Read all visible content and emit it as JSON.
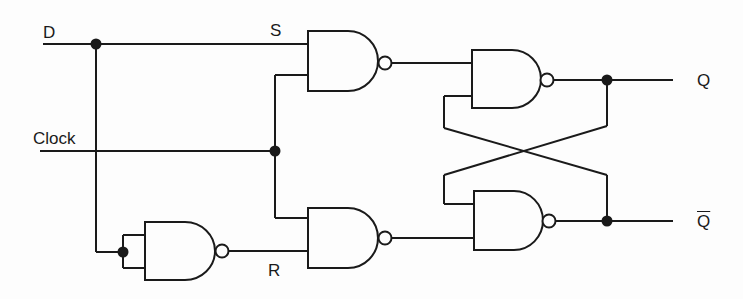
{
  "diagram": {
    "labels": {
      "d_input": "D",
      "clock_input": "Clock",
      "s_signal": "S",
      "r_signal": "R",
      "q_output": "Q",
      "q_bar_output": "Q"
    },
    "components": [
      {
        "id": "inverter-nand",
        "type": "NAND",
        "role": "inverter",
        "inputs_tied": true
      },
      {
        "id": "s-nand",
        "type": "NAND",
        "inputs": [
          "D",
          "Clock"
        ],
        "output": "S"
      },
      {
        "id": "r-nand",
        "type": "NAND",
        "inputs": [
          "Clock",
          "NOT D"
        ],
        "output": "R"
      },
      {
        "id": "latch-top-nand",
        "type": "NAND",
        "inputs": [
          "S",
          "Q-bar"
        ],
        "output": "Q"
      },
      {
        "id": "latch-bottom-nand",
        "type": "NAND",
        "inputs": [
          "Q",
          "R"
        ],
        "output": "Q-bar"
      }
    ],
    "colors": {
      "line": "#1a1a1a",
      "background": "#fdfdfd"
    }
  }
}
